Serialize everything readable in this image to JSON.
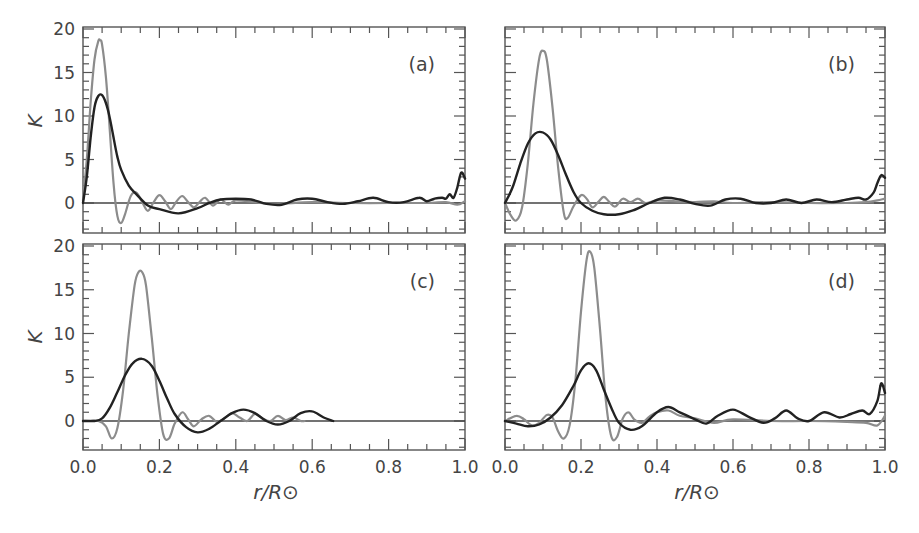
{
  "chart_data": [
    {
      "type": "line",
      "panel": "a",
      "label": "(a)",
      "xlabel": "r/R⊙",
      "ylabel": "K",
      "xlim": [
        0.0,
        1.0
      ],
      "ylim": [
        -3.4,
        20
      ],
      "xticks": [
        "0.0",
        "0.2",
        "0.4",
        "0.6",
        "0.8",
        "1.0"
      ],
      "yticks": [
        "0",
        "5",
        "10",
        "15",
        "20"
      ],
      "show_x_ticklabels": false,
      "show_y_ticklabels": true,
      "series": [
        {
          "name": "gray (target kernel)",
          "color": "#8c8c8c",
          "x": [
            0.0,
            0.01,
            0.02,
            0.03,
            0.04,
            0.045,
            0.05,
            0.06,
            0.07,
            0.08,
            0.09,
            0.1,
            0.11,
            0.125,
            0.14,
            0.155,
            0.17,
            0.185,
            0.2,
            0.215,
            0.23,
            0.245,
            0.26,
            0.275,
            0.29,
            0.305,
            0.32,
            0.34,
            0.36,
            0.38,
            0.4,
            0.45,
            0.5,
            0.6,
            0.7,
            0.8,
            0.9,
            0.95,
            0.98,
            1.0
          ],
          "y": [
            0.3,
            5.0,
            11.5,
            16.5,
            18.6,
            18.7,
            18.2,
            14.5,
            8.5,
            2.2,
            -1.5,
            -2.3,
            -1.3,
            0.8,
            1.2,
            0.1,
            -0.9,
            0.1,
            0.9,
            0.2,
            -0.7,
            0.2,
            0.8,
            0.1,
            -0.5,
            0.1,
            0.6,
            -0.3,
            0.4,
            -0.2,
            0.3,
            0.1,
            -0.1,
            0.1,
            0.0,
            0.0,
            0.0,
            0.1,
            -0.2,
            0.2
          ]
        },
        {
          "name": "black (averaging kernel)",
          "color": "#222222",
          "x": [
            0.0,
            0.01,
            0.02,
            0.03,
            0.04,
            0.05,
            0.06,
            0.07,
            0.08,
            0.09,
            0.1,
            0.12,
            0.14,
            0.17,
            0.2,
            0.25,
            0.3,
            0.33,
            0.36,
            0.4,
            0.44,
            0.48,
            0.52,
            0.56,
            0.6,
            0.64,
            0.68,
            0.72,
            0.76,
            0.8,
            0.84,
            0.88,
            0.9,
            0.92,
            0.94,
            0.95,
            0.96,
            0.97,
            0.98,
            0.99,
            1.0
          ],
          "y": [
            0.0,
            3.0,
            7.5,
            11.0,
            12.3,
            12.4,
            11.5,
            9.8,
            7.5,
            5.3,
            3.8,
            2.0,
            1.0,
            -0.3,
            -0.7,
            -1.2,
            -0.6,
            0.0,
            0.4,
            0.5,
            0.4,
            -0.1,
            -0.2,
            0.4,
            0.5,
            0.1,
            -0.1,
            0.2,
            0.6,
            0.1,
            0.1,
            0.6,
            0.2,
            0.5,
            0.6,
            0.5,
            1.0,
            0.6,
            1.8,
            3.5,
            2.8
          ]
        }
      ]
    },
    {
      "type": "line",
      "panel": "b",
      "label": "(b)",
      "xlabel": "r/R⊙",
      "ylabel": "",
      "xlim": [
        0.0,
        1.0
      ],
      "ylim": [
        -3.4,
        20
      ],
      "xticks": [
        "0.0",
        "0.2",
        "0.4",
        "0.6",
        "0.8",
        "1.0"
      ],
      "yticks": [
        "0",
        "5",
        "10",
        "15",
        "20"
      ],
      "show_x_ticklabels": false,
      "show_y_ticklabels": false,
      "series": [
        {
          "name": "gray (target kernel)",
          "color": "#8c8c8c",
          "x": [
            0.0,
            0.015,
            0.03,
            0.045,
            0.06,
            0.075,
            0.09,
            0.1,
            0.11,
            0.125,
            0.14,
            0.155,
            0.165,
            0.18,
            0.2,
            0.215,
            0.23,
            0.245,
            0.26,
            0.275,
            0.29,
            0.31,
            0.33,
            0.35,
            0.37,
            0.4,
            0.45,
            0.5,
            0.55,
            0.6,
            0.7,
            0.8,
            0.9,
            0.95,
            0.98,
            1.0
          ],
          "y": [
            0.0,
            -1.4,
            -2.0,
            -0.5,
            4.5,
            11.5,
            16.6,
            17.5,
            16.5,
            11.0,
            4.0,
            -1.2,
            -1.7,
            -0.4,
            0.9,
            0.5,
            -0.5,
            0.1,
            0.7,
            0.1,
            -0.4,
            0.5,
            0.1,
            0.5,
            0.0,
            0.3,
            0.2,
            0.1,
            0.2,
            0.0,
            0.1,
            0.0,
            0.0,
            0.1,
            0.3,
            0.5
          ]
        },
        {
          "name": "black (averaging kernel)",
          "color": "#222222",
          "x": [
            0.0,
            0.02,
            0.04,
            0.06,
            0.08,
            0.1,
            0.12,
            0.14,
            0.16,
            0.18,
            0.2,
            0.23,
            0.26,
            0.3,
            0.34,
            0.38,
            0.42,
            0.46,
            0.5,
            0.54,
            0.58,
            0.62,
            0.66,
            0.7,
            0.74,
            0.78,
            0.82,
            0.86,
            0.9,
            0.93,
            0.95,
            0.97,
            0.98,
            0.99,
            1.0
          ],
          "y": [
            0.0,
            1.8,
            4.5,
            6.8,
            8.0,
            8.1,
            7.3,
            5.5,
            3.3,
            1.3,
            0.0,
            -0.9,
            -1.3,
            -1.3,
            -0.8,
            0.0,
            0.6,
            0.4,
            -0.1,
            -0.3,
            0.4,
            0.5,
            0.0,
            0.0,
            0.4,
            0.0,
            0.4,
            0.1,
            0.4,
            0.6,
            0.4,
            1.2,
            2.3,
            3.2,
            2.9
          ]
        }
      ]
    },
    {
      "type": "line",
      "panel": "c",
      "label": "(c)",
      "xlabel": "r/R⊙",
      "ylabel": "K",
      "xlim": [
        0.0,
        1.0
      ],
      "ylim": [
        -3.3,
        20
      ],
      "xticks": [
        "0.0",
        "0.2",
        "0.4",
        "0.6",
        "0.8",
        "1.0"
      ],
      "yticks": [
        "0",
        "5",
        "10",
        "15",
        "20"
      ],
      "show_x_ticklabels": true,
      "show_y_ticklabels": true,
      "series": [
        {
          "name": "gray (target kernel)",
          "color": "#8c8c8c",
          "x": [
            0.0,
            0.04,
            0.06,
            0.075,
            0.09,
            0.105,
            0.12,
            0.135,
            0.145,
            0.155,
            0.165,
            0.18,
            0.195,
            0.21,
            0.225,
            0.24,
            0.26,
            0.275,
            0.29,
            0.31,
            0.33,
            0.35,
            0.37,
            0.39,
            0.41,
            0.43,
            0.45,
            0.47,
            0.49,
            0.51,
            0.53,
            0.55,
            0.57,
            0.58
          ],
          "y": [
            0.0,
            0.0,
            -0.6,
            -2.0,
            -0.8,
            3.5,
            10.0,
            15.5,
            17.0,
            17.0,
            15.5,
            9.5,
            3.0,
            -1.5,
            -2.0,
            -0.3,
            1.0,
            0.2,
            -0.6,
            0.2,
            0.6,
            -0.1,
            0.3,
            0.9,
            0.4,
            0.0,
            0.8,
            0.3,
            0.0,
            0.6,
            0.1,
            0.4,
            0.0,
            0.0
          ]
        },
        {
          "name": "black (averaging kernel)",
          "color": "#222222",
          "x": [
            0.0,
            0.03,
            0.05,
            0.07,
            0.09,
            0.11,
            0.13,
            0.155,
            0.18,
            0.2,
            0.22,
            0.24,
            0.27,
            0.3,
            0.33,
            0.36,
            0.39,
            0.42,
            0.45,
            0.48,
            0.51,
            0.54,
            0.57,
            0.6,
            0.63,
            0.655
          ],
          "y": [
            0.0,
            0.0,
            0.3,
            1.5,
            3.3,
            5.2,
            6.6,
            7.1,
            6.3,
            4.6,
            2.6,
            0.8,
            -0.7,
            -1.3,
            -0.9,
            0.0,
            0.9,
            1.3,
            0.9,
            0.0,
            -0.4,
            0.0,
            0.9,
            1.1,
            0.4,
            0.0
          ]
        }
      ]
    },
    {
      "type": "line",
      "panel": "d",
      "label": "(d)",
      "xlabel": "r/R⊙",
      "ylabel": "",
      "xlim": [
        0.0,
        1.0
      ],
      "ylim": [
        -3.3,
        20
      ],
      "xticks": [
        "0.0",
        "0.2",
        "0.4",
        "0.6",
        "0.8",
        "1.0"
      ],
      "yticks": [
        "0",
        "5",
        "10",
        "15",
        "20"
      ],
      "show_x_ticklabels": true,
      "show_y_ticklabels": false,
      "series": [
        {
          "name": "gray (target kernel)",
          "color": "#8c8c8c",
          "x": [
            0.0,
            0.03,
            0.05,
            0.07,
            0.09,
            0.11,
            0.125,
            0.14,
            0.155,
            0.17,
            0.185,
            0.2,
            0.215,
            0.225,
            0.235,
            0.25,
            0.265,
            0.28,
            0.295,
            0.31,
            0.325,
            0.34,
            0.36,
            0.38,
            0.4,
            0.43,
            0.46,
            0.5,
            0.55,
            0.6,
            0.7,
            0.8,
            0.9,
            0.95,
            0.98,
            1.0
          ],
          "y": [
            0.0,
            0.6,
            0.2,
            -0.5,
            -0.2,
            0.7,
            0.4,
            -1.2,
            -2.0,
            -0.5,
            4.5,
            12.5,
            18.5,
            19.3,
            17.5,
            10.5,
            2.5,
            -1.8,
            -1.8,
            0.3,
            1.0,
            0.2,
            -0.2,
            0.5,
            1.0,
            1.2,
            0.6,
            0.3,
            -0.2,
            0.2,
            0.0,
            0.0,
            -0.1,
            -0.2,
            -0.5,
            0.6
          ]
        },
        {
          "name": "black (averaging kernel)",
          "color": "#222222",
          "x": [
            0.0,
            0.03,
            0.06,
            0.09,
            0.12,
            0.15,
            0.18,
            0.2,
            0.22,
            0.24,
            0.26,
            0.28,
            0.3,
            0.33,
            0.36,
            0.4,
            0.43,
            0.46,
            0.5,
            0.53,
            0.56,
            0.6,
            0.64,
            0.68,
            0.71,
            0.74,
            0.77,
            0.8,
            0.84,
            0.88,
            0.91,
            0.94,
            0.96,
            0.98,
            0.99,
            1.0
          ],
          "y": [
            0.0,
            -0.3,
            -0.6,
            -0.4,
            0.4,
            1.8,
            4.0,
            5.8,
            6.6,
            5.8,
            3.6,
            1.5,
            -0.2,
            -1.0,
            -0.6,
            1.0,
            1.6,
            1.0,
            0.2,
            -0.3,
            0.6,
            1.3,
            0.5,
            -0.2,
            0.3,
            1.2,
            0.3,
            0.0,
            1.0,
            0.4,
            0.8,
            1.2,
            0.8,
            2.3,
            4.3,
            3.2
          ]
        }
      ]
    }
  ],
  "figure": {
    "xlabel_left": "r/R⊙",
    "xlabel_right": "r/R⊙",
    "ylabel_top": "K",
    "ylabel_bottom": "K",
    "colors": {
      "axis": "#555555",
      "gray_curve": "#8c8c8c",
      "black_curve": "#222222",
      "zero_line": "#444444"
    }
  }
}
